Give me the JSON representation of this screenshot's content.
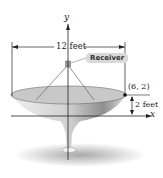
{
  "diagram": {
    "axis_labels": {
      "x": "x",
      "y": "y"
    },
    "width_label": "12 feet",
    "depth_label": "2 feet",
    "point_label": "(6, 2)",
    "receiver_label": "Receiver",
    "colors": {
      "dish_light": "#e6e6e6",
      "dish_dark": "#9a9a9a",
      "axis": "#222222",
      "ground": "#bdbdbd"
    }
  }
}
